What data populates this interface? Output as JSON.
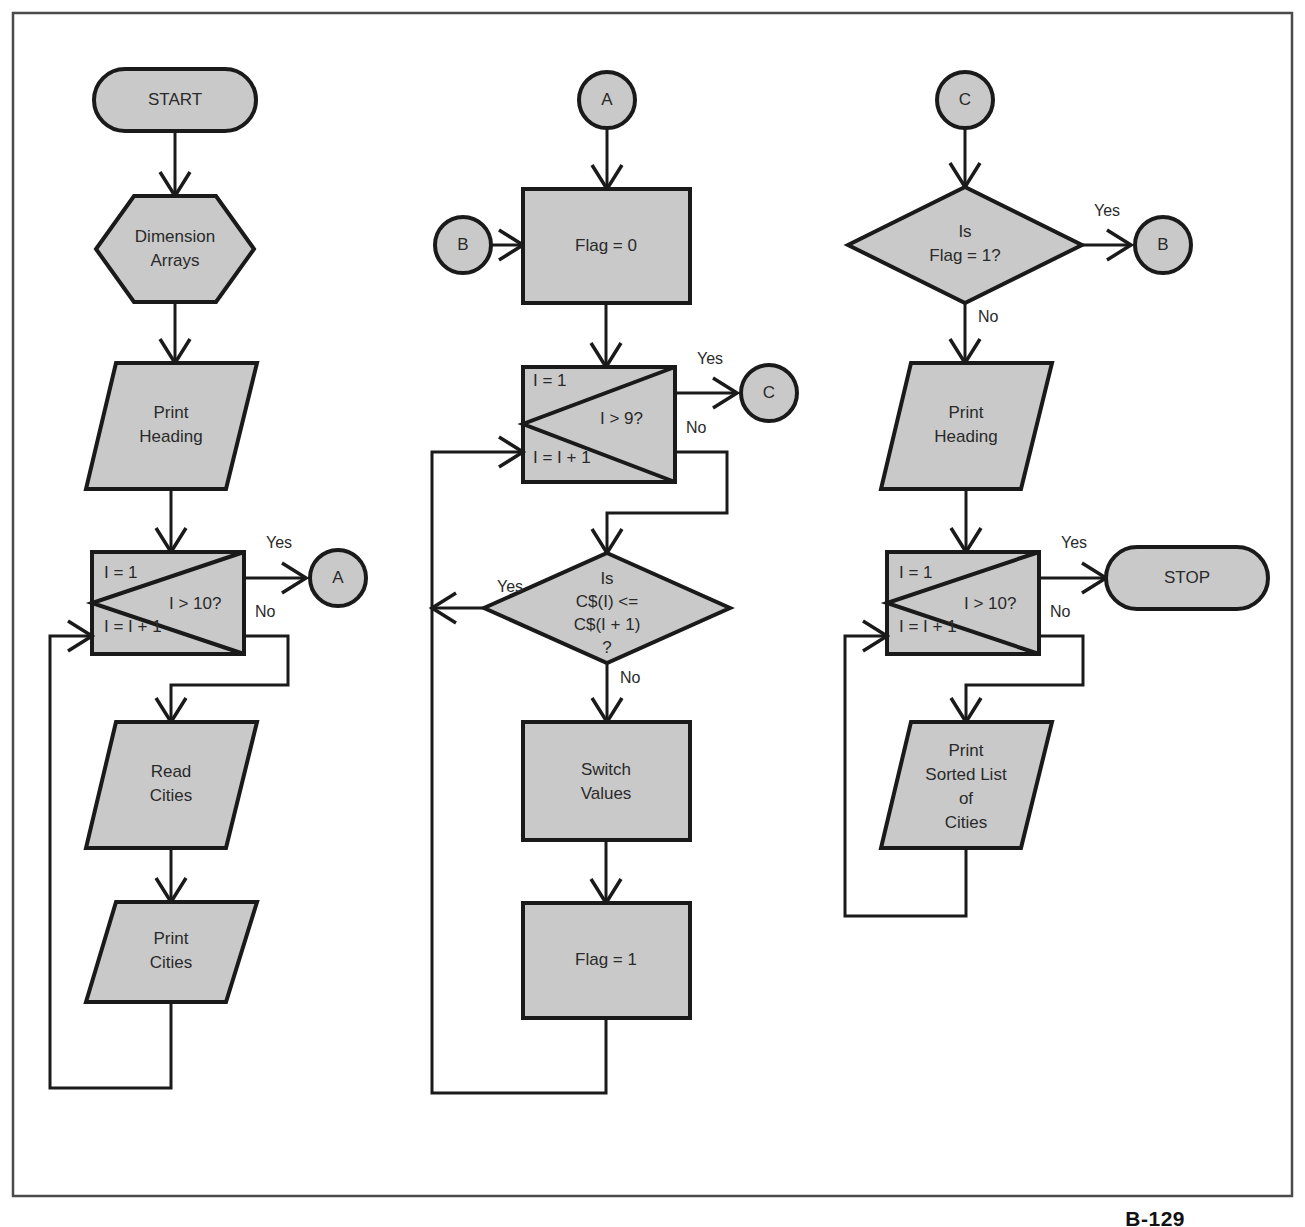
{
  "diagram": {
    "page_label": "B-129",
    "colors": {
      "shape_fill": "#c9c9c9",
      "stroke": "#1a1a1a",
      "text": "#2a2a2a",
      "frame": "#4a4a4a"
    }
  },
  "column1": {
    "start": "START",
    "dimension": {
      "line1": "Dimension",
      "line2": "Arrays"
    },
    "print_heading": {
      "line1": "Print",
      "line2": "Heading"
    },
    "loop": {
      "init": "I = 1",
      "incr": "I = I + 1",
      "test": "I > 10?",
      "yes": "Yes",
      "no": "No"
    },
    "connector_a": "A",
    "read_cities": {
      "line1": "Read",
      "line2": "Cities"
    },
    "print_cities": {
      "line1": "Print",
      "line2": "Cities"
    }
  },
  "column2": {
    "connector_a": "A",
    "connector_b": "B",
    "flag_zero": "Flag = 0",
    "loop": {
      "init": "I = 1",
      "incr": "I = I + 1",
      "test": "I > 9?",
      "yes": "Yes",
      "no": "No"
    },
    "connector_c": "C",
    "decision": {
      "line1": "Is",
      "line2": "C$(I) <=",
      "line3": "C$(I + 1)",
      "line4": "?",
      "yes": "Yes",
      "no": "No"
    },
    "switch_values": {
      "line1": "Switch",
      "line2": "Values"
    },
    "flag_one": "Flag = 1"
  },
  "column3": {
    "connector_c": "C",
    "decision": {
      "line1": "Is",
      "line2": "Flag = 1?",
      "yes": "Yes",
      "no": "No"
    },
    "connector_b": "B",
    "print_heading": {
      "line1": "Print",
      "line2": "Heading"
    },
    "loop": {
      "init": "I = 1",
      "incr": "I = I + 1",
      "test": "I > 10?",
      "yes": "Yes",
      "no": "No"
    },
    "stop": "STOP",
    "print_sorted": {
      "line1": "Print",
      "line2": "Sorted List",
      "line3": "of",
      "line4": "Cities"
    }
  }
}
